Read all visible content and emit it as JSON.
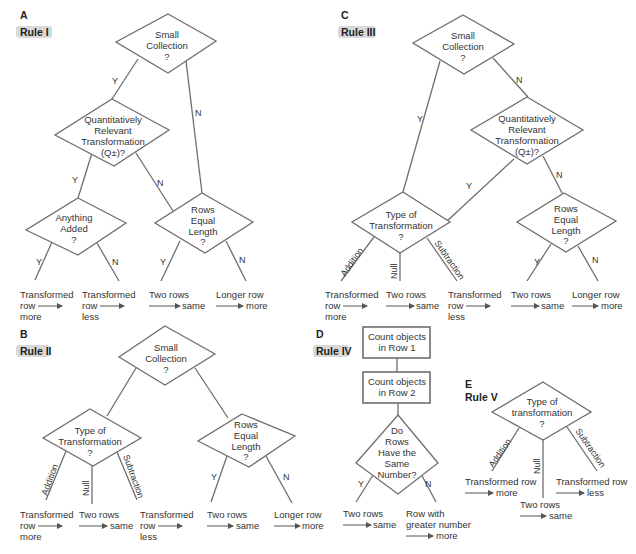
{
  "panels": {
    "A": {
      "letter": "A",
      "rule": "Rule I",
      "q1": [
        "Small",
        "Collection",
        "?"
      ],
      "q2": [
        "Quantitatively",
        "Relevant",
        "Transformation",
        "(Q±)?"
      ],
      "q3": [
        "Anything",
        "Added",
        "?"
      ],
      "q4": [
        "Rows",
        "Equal",
        "Length",
        "?"
      ],
      "branches": {
        "y": "Y",
        "n": "N"
      },
      "outcomes": [
        {
          "line1": "Transformed",
          "line2": "row",
          "line3": "more"
        },
        {
          "line1": "Transformed",
          "line2": "row",
          "line3": "less"
        },
        {
          "line1": "Two rows",
          "line2": "same"
        },
        {
          "line1": "Longer row",
          "line2": "more"
        }
      ]
    },
    "B": {
      "letter": "B",
      "rule": "Rule II",
      "q1": [
        "Small",
        "Collection",
        "?"
      ],
      "q2": [
        "Type of",
        "Transformation",
        "?"
      ],
      "q3": [
        "Rows",
        "Equal",
        "Length",
        "?"
      ],
      "branches": {
        "addition": "Addition",
        "null": "Null",
        "subtraction": "Subtraction",
        "y": "Y",
        "n": "N"
      },
      "outcomes": [
        {
          "line1": "Transformed",
          "line2": "row",
          "line3": "more"
        },
        {
          "line1": "Two rows",
          "line2": "same"
        },
        {
          "line1": "Transformed",
          "line2": "row",
          "line3": "less"
        },
        {
          "line1": "Two rows",
          "line2": "same"
        },
        {
          "line1": "Longer row",
          "line2": "more"
        }
      ]
    },
    "C": {
      "letter": "C",
      "rule": "Rule III",
      "q1": [
        "Small",
        "Collection",
        "?"
      ],
      "q2": [
        "Quantitatively",
        "Relevant",
        "Transformation",
        "(Q±)?"
      ],
      "q3": [
        "Type of",
        "Transformation",
        "?"
      ],
      "q4": [
        "Rows",
        "Equal",
        "Length",
        "?"
      ],
      "branches": {
        "y": "Y",
        "n": "N",
        "addition": "Addition",
        "null": "Null",
        "subtraction": "Subtraction"
      },
      "outcomes": [
        {
          "line1": "Transformed",
          "line2": "row",
          "line3": "more"
        },
        {
          "line1": "Two rows",
          "line2": "same"
        },
        {
          "line1": "Transformed",
          "line2": "row",
          "line3": "less"
        },
        {
          "line1": "Two rows",
          "line2": "same"
        },
        {
          "line1": "Longer row",
          "line2": "more"
        }
      ]
    },
    "D": {
      "letter": "D",
      "rule": "Rule IV",
      "box1": [
        "Count objects",
        "in Row 1"
      ],
      "box2": [
        "Count objects",
        "in Row 2"
      ],
      "q1": [
        "Do",
        "Rows",
        "Have the",
        "Same",
        "Number?"
      ],
      "branches": {
        "y": "Y",
        "n": "N"
      },
      "outcomes": [
        {
          "line1": "Two rows",
          "line2": "same"
        },
        {
          "line1": "Row with",
          "line2": "greater number",
          "line3": "more"
        }
      ]
    },
    "E": {
      "letter": "E",
      "rule": "Rule V",
      "q1": [
        "Type of",
        "transformation",
        "?"
      ],
      "branches": {
        "addition": "Addition",
        "null": "Null",
        "subtraction": "Subtraction"
      },
      "outcomes": [
        {
          "line1": "Transformed row",
          "line2": "more"
        },
        {
          "line1": "Two rows",
          "line2": "same"
        },
        {
          "line1": "Transformed row",
          "line2": "less"
        }
      ]
    }
  }
}
